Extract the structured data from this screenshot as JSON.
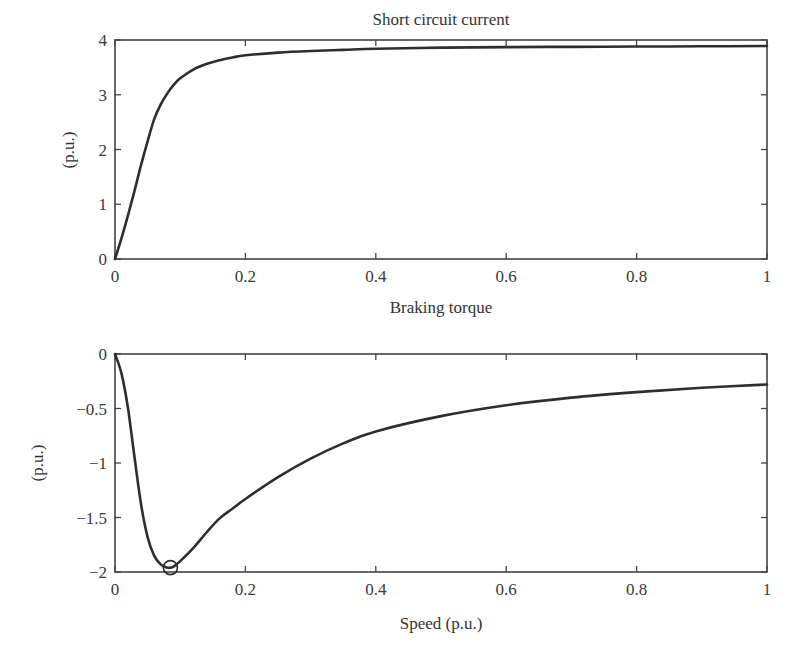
{
  "chart_data": [
    {
      "type": "line",
      "title": "Short circuit current",
      "xlabel": "",
      "ylabel": "(p.u.)",
      "xlim": [
        0,
        1
      ],
      "ylim": [
        0,
        4
      ],
      "xticks": [
        "0",
        "0.2",
        "0.4",
        "0.6",
        "0.8",
        "1"
      ],
      "yticks": [
        "0",
        "1",
        "2",
        "3",
        "4"
      ],
      "grid": false,
      "legend": null,
      "series": [
        {
          "name": "Short circuit current",
          "x": [
            0,
            0.01,
            0.02,
            0.03,
            0.04,
            0.05,
            0.06,
            0.07,
            0.08,
            0.09,
            0.1,
            0.12,
            0.14,
            0.16,
            0.18,
            0.2,
            0.25,
            0.3,
            0.35,
            0.4,
            0.5,
            0.6,
            0.7,
            0.8,
            0.9,
            1.0
          ],
          "y": [
            0,
            0.38,
            0.8,
            1.25,
            1.72,
            2.15,
            2.55,
            2.82,
            3.02,
            3.18,
            3.3,
            3.46,
            3.56,
            3.63,
            3.68,
            3.72,
            3.77,
            3.8,
            3.82,
            3.84,
            3.86,
            3.87,
            3.875,
            3.88,
            3.885,
            3.89
          ]
        }
      ]
    },
    {
      "type": "line",
      "title": "Braking torque",
      "xlabel": "Speed (p.u.)",
      "ylabel": "(p.u.)",
      "xlim": [
        0,
        1
      ],
      "ylim": [
        -2,
        0
      ],
      "xticks": [
        "0",
        "0.2",
        "0.4",
        "0.6",
        "0.8",
        "1"
      ],
      "yticks": [
        "0",
        "−0.5",
        "−1",
        "−1.5",
        "−2"
      ],
      "grid": false,
      "legend": null,
      "annotations": [
        {
          "type": "circle-marker",
          "x": 0.085,
          "y": -1.96,
          "label": "maximum braking torque point"
        }
      ],
      "series": [
        {
          "name": "Braking torque",
          "x": [
            0,
            0.01,
            0.02,
            0.03,
            0.04,
            0.05,
            0.06,
            0.07,
            0.08,
            0.085,
            0.09,
            0.1,
            0.12,
            0.14,
            0.16,
            0.18,
            0.2,
            0.25,
            0.3,
            0.35,
            0.4,
            0.5,
            0.6,
            0.7,
            0.8,
            0.9,
            1.0
          ],
          "y": [
            0,
            -0.18,
            -0.5,
            -0.95,
            -1.38,
            -1.68,
            -1.85,
            -1.93,
            -1.96,
            -1.96,
            -1.95,
            -1.9,
            -1.78,
            -1.64,
            -1.51,
            -1.42,
            -1.33,
            -1.13,
            -0.96,
            -0.82,
            -0.71,
            -0.57,
            -0.47,
            -0.4,
            -0.35,
            -0.31,
            -0.28
          ]
        }
      ]
    }
  ]
}
